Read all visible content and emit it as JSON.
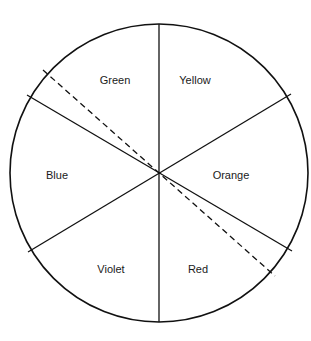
{
  "diagram": {
    "type": "color-wheel",
    "center": [
      159,
      173
    ],
    "radius": 149,
    "stroke_color": "#111111",
    "segments": [
      {
        "label": "Green",
        "x": 115,
        "y": 84
      },
      {
        "label": "Yellow",
        "x": 195,
        "y": 84
      },
      {
        "label": "Blue",
        "x": 57,
        "y": 179
      },
      {
        "label": "Orange",
        "x": 231,
        "y": 179
      },
      {
        "label": "Violet",
        "x": 111,
        "y": 273
      },
      {
        "label": "Red",
        "x": 198,
        "y": 273
      }
    ],
    "lines": [
      {
        "x1": 159,
        "y1": 24,
        "x2": 159,
        "y2": 322,
        "style": "solid"
      },
      {
        "x1": 28,
        "y1": 252,
        "x2": 291,
        "y2": 94,
        "style": "solid"
      },
      {
        "x1": 27,
        "y1": 95,
        "x2": 292,
        "y2": 251,
        "style": "solid"
      },
      {
        "x1": 43,
        "y1": 70,
        "x2": 275,
        "y2": 276,
        "style": "dashed"
      }
    ]
  }
}
